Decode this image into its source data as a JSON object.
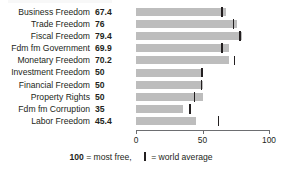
{
  "chart_data": {
    "type": "bar",
    "orientation": "horizontal",
    "title": "",
    "xlabel": "",
    "ylabel": "",
    "xlim": [
      0,
      100
    ],
    "xticks": [
      0,
      50,
      100
    ],
    "xtick_labels": [
      "0",
      "50",
      "100"
    ],
    "grid": false,
    "legend_position": "bottom-center",
    "categories": [
      "Business Freedom",
      "Trade Freedom",
      "Fiscal Freedom",
      "Fdm fm Government",
      "Monetary Freedom",
      "Investment Freedom",
      "Financial Freedom",
      "Property Rights",
      "Fdm fm Corruption",
      "Labor Freedom"
    ],
    "values": [
      67.4,
      76,
      79.4,
      69.9,
      70.2,
      50,
      50,
      50,
      35,
      45.4
    ],
    "value_labels": [
      "67.4",
      "76",
      "79.4",
      "69.9",
      "70.2",
      "50",
      "50",
      "50",
      "35",
      "45.4"
    ],
    "series": [
      {
        "name": "Country score",
        "values": [
          67.4,
          76,
          79.4,
          69.9,
          70.2,
          50,
          50,
          50,
          35,
          45.4
        ]
      },
      {
        "name": "world average",
        "marker": "vertical-line",
        "values": [
          64.7,
          73.4,
          78.4,
          64.5,
          74.2,
          49.5,
          49.3,
          44.0,
          40.5,
          62.1
        ]
      }
    ],
    "colors": {
      "bar": "#bdbdbd",
      "world_average_marker": "#231f20",
      "axis": "#6d6e71",
      "text": "#231f20",
      "background": "#ffffff"
    }
  },
  "legend": {
    "most_free_value": "100",
    "most_free_text": "= most free,",
    "world_average_text": "= world average"
  }
}
